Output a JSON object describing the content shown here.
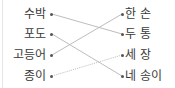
{
  "exercise": {
    "left_items": [
      {
        "label": "수박"
      },
      {
        "label": "포도"
      },
      {
        "label": "고등어"
      },
      {
        "label": "종이"
      }
    ],
    "right_items": [
      {
        "label": "한 손"
      },
      {
        "label": "두 통"
      },
      {
        "label": "세 장"
      },
      {
        "label": "네 송이"
      }
    ],
    "connections": [
      {
        "from": "수박",
        "to": "두 통",
        "style": "solid"
      },
      {
        "from": "포도",
        "to": "네 송이",
        "style": "solid"
      },
      {
        "from": "고등어",
        "to": "한 손",
        "style": "solid"
      },
      {
        "from": "종이",
        "to": "세 장",
        "style": "dotted"
      }
    ],
    "colors": {
      "text": "#3a3a3a",
      "line": "#bdbdbd",
      "dot": "#555555"
    }
  }
}
